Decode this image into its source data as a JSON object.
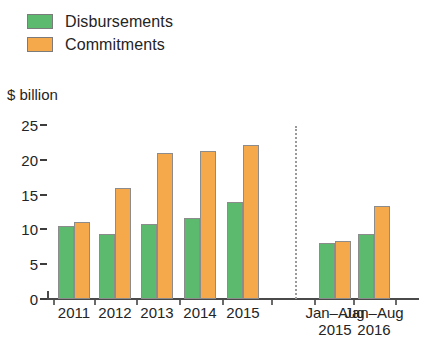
{
  "legend": {
    "items": [
      {
        "label": "Disbursements",
        "color": "#5cba6e",
        "swatch_name": "legend-swatch-disbursements"
      },
      {
        "label": "Commitments",
        "color": "#f5a94a",
        "swatch_name": "legend-swatch-commitments"
      }
    ]
  },
  "axis_title": "$ billion",
  "chart_data": {
    "type": "bar",
    "title": "",
    "subtitle": "",
    "xlabel": "",
    "ylabel": "$ billion",
    "ylim": [
      0,
      25
    ],
    "yticks": [
      0,
      5,
      10,
      15,
      20,
      25
    ],
    "ytick_labels": [
      "0",
      "5",
      "10",
      "15",
      "20",
      "25"
    ],
    "grid": false,
    "legend_position": "top-left",
    "categories": [
      "2011",
      "2012",
      "2013",
      "2014",
      "2015",
      "Jan–Aug 2015",
      "Jan–Aug 2016"
    ],
    "category_labels": [
      {
        "line1": "2011",
        "line2": ""
      },
      {
        "line1": "2012",
        "line2": ""
      },
      {
        "line1": "2013",
        "line2": ""
      },
      {
        "line1": "2014",
        "line2": ""
      },
      {
        "line1": "2015",
        "line2": ""
      },
      {
        "line1": "Jan–Aug",
        "line2": "2015"
      },
      {
        "line1": "Jan–Aug",
        "line2": "2016"
      }
    ],
    "series": [
      {
        "name": "Disbursements",
        "color": "#5cba6e",
        "values": [
          10.5,
          9.4,
          10.8,
          11.7,
          13.9,
          8.0,
          9.4
        ]
      },
      {
        "name": "Commitments",
        "color": "#f5a94a",
        "values": [
          11.0,
          15.9,
          21.0,
          21.3,
          22.1,
          8.3,
          13.3
        ]
      }
    ],
    "annotations": [
      {
        "type": "vertical-divider",
        "style": "dotted",
        "after_category": "2015"
      }
    ]
  }
}
